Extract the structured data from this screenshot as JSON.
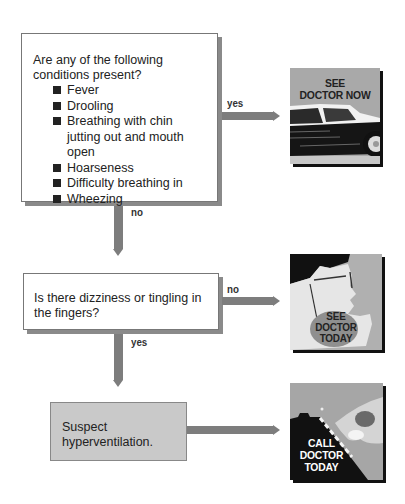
{
  "question1": {
    "prompt": "Are any of the following conditions present?",
    "conditions": [
      "Fever",
      "Drooling",
      "Breathing with chin jutting out and mouth open",
      "Hoarseness",
      "Difficulty breathing in",
      "Wheezing"
    ],
    "yes_label": "yes",
    "no_label": "no"
  },
  "question2": {
    "prompt": "Is there dizziness or tingling in the fingers?",
    "no_label": "no",
    "yes_label": "yes"
  },
  "conclusion": {
    "text": "Suspect hyperventilation."
  },
  "outcomes": [
    {
      "line1": "SEE",
      "line2": "DOCTOR NOW",
      "icon": "car-icon"
    },
    {
      "line1": "SEE",
      "line2": "DOCTOR",
      "line3": "TODAY",
      "icon": "face-profile-icon"
    },
    {
      "line1": "CALL",
      "line2": "DOCTOR",
      "line3": "TODAY",
      "icon": "phone-dial-icon"
    }
  ],
  "colors": {
    "arrow": "#7d7d7d",
    "conclusion_fill": "#c9c9c9",
    "picture_gray": "#a8a8a8"
  }
}
